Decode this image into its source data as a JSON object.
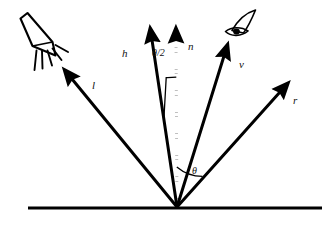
{
  "diagram": {
    "background_color": "#ffffff",
    "ink_color": "#000000",
    "surface": {
      "name": "surface-baseline",
      "x1": 28,
      "y1": 208,
      "x2": 322,
      "y2": 208,
      "stroke_width": 3
    },
    "origin": {
      "x": 177,
      "y": 207
    },
    "vectors": [
      {
        "id": "l",
        "label": "l",
        "meaning": "light-direction-vector",
        "tip_x": 68,
        "tip_y": 75,
        "label_x": 92,
        "label_y": 86,
        "style": "solid",
        "stroke_width": 3
      },
      {
        "id": "h",
        "label": "h",
        "meaning": "halfway-vector",
        "tip_x": 150,
        "tip_y": 32,
        "label_x": 124,
        "label_y": 54,
        "style": "solid",
        "stroke_width": 3
      },
      {
        "id": "n",
        "label": "n",
        "meaning": "surface-normal-vector",
        "tip_x": 176,
        "tip_y": 30,
        "label_x": 189,
        "label_y": 47,
        "style": "dotted",
        "stroke_width": 3
      },
      {
        "id": "v",
        "label": "v",
        "meaning": "view-direction-vector",
        "tip_x": 228,
        "tip_y": 47,
        "label_x": 240,
        "label_y": 65,
        "style": "solid",
        "stroke_width": 3
      },
      {
        "id": "r",
        "label": "r",
        "meaning": "reflection-vector",
        "tip_x": 286,
        "tip_y": 85,
        "label_x": 294,
        "label_y": 101,
        "style": "solid",
        "stroke_width": 3
      }
    ],
    "angles": [
      {
        "id": "theta-half",
        "label": "θ/2",
        "meaning": "angle-between-h-and-n",
        "label_x": 154,
        "label_y": 54,
        "arc_from_vector": "h",
        "arc_to_vector": "n",
        "arc_radius": 88
      },
      {
        "id": "theta",
        "label": "θ",
        "meaning": "angle-between-n-and-r",
        "label_x": 194,
        "label_y": 172,
        "arc_from_vector": "n",
        "arc_to_vector": "r",
        "arc_radius": 40
      }
    ],
    "icons": [
      {
        "id": "light-source",
        "name": "flashlight-icon",
        "meaning": "light-source-emitting-rays",
        "ray_count": 5,
        "x": 14,
        "y": 14,
        "width": 62,
        "height": 60
      },
      {
        "id": "viewer",
        "name": "eye-icon",
        "meaning": "viewer-camera-eye",
        "x": 218,
        "y": 8,
        "width": 46,
        "height": 38
      }
    ]
  }
}
